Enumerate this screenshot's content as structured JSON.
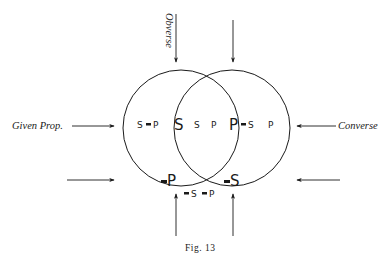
{
  "figure": {
    "caption": "Fig. 13",
    "labels": {
      "obverse": "Obverse",
      "given_prop": "Given Prop.",
      "converse": "Converse"
    },
    "regions": {
      "left_only_s": "S",
      "left_only_dash": "-",
      "left_only_p": "P",
      "big_s": "S",
      "middle_s": "S",
      "middle_p": "P",
      "big_p": "P",
      "right_only_dash": "-",
      "right_only_s": "S",
      "right_only_p": "P",
      "bottom_left_dash": "-",
      "bottom_left_p": "P",
      "bottom_right_dash": "-",
      "bottom_right_s": "S",
      "outside_dash1": "-",
      "outside_s": "S",
      "outside_dash2": "-",
      "outside_p": "P"
    },
    "circles": [
      {
        "name": "S-circle",
        "cx": 181,
        "cy": 128,
        "r": 58
      },
      {
        "name": "P-circle",
        "cx": 232,
        "cy": 128,
        "r": 58
      }
    ],
    "arrows": [
      {
        "name": "arrow-top-left",
        "direction": "down"
      },
      {
        "name": "arrow-top-right",
        "direction": "down"
      },
      {
        "name": "arrow-given-prop",
        "direction": "right"
      },
      {
        "name": "arrow-converse",
        "direction": "left"
      },
      {
        "name": "arrow-lower-left",
        "direction": "right"
      },
      {
        "name": "arrow-lower-right",
        "direction": "left"
      },
      {
        "name": "arrow-bottom-left",
        "direction": "up"
      },
      {
        "name": "arrow-bottom-right",
        "direction": "up"
      }
    ]
  }
}
